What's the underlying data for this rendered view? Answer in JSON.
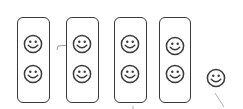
{
  "diagram": {
    "groups": [
      {
        "count": 2,
        "x": 17,
        "y": 17,
        "w": 33,
        "h": 86,
        "faces": [
          {
            "cx": 33,
            "cy": 44
          },
          {
            "cx": 33,
            "cy": 74
          }
        ]
      },
      {
        "count": 2,
        "x": 66,
        "y": 17,
        "w": 33,
        "h": 86,
        "faces": [
          {
            "cx": 82,
            "cy": 44
          },
          {
            "cx": 82,
            "cy": 74
          }
        ]
      },
      {
        "count": 2,
        "x": 114,
        "y": 17,
        "w": 33,
        "h": 86,
        "faces": [
          {
            "cx": 130,
            "cy": 44
          },
          {
            "cx": 130,
            "cy": 74
          }
        ]
      },
      {
        "count": 2,
        "x": 159,
        "y": 17,
        "w": 32,
        "h": 86,
        "faces": [
          {
            "cx": 175,
            "cy": 46
          },
          {
            "cx": 175,
            "cy": 74
          }
        ]
      }
    ],
    "remainder": {
      "count": 1,
      "cx": 216,
      "cy": 78
    },
    "colors": {
      "stroke": "#3a3a3a",
      "background": "#ffffff",
      "pencil": "#9a9a9a"
    }
  }
}
